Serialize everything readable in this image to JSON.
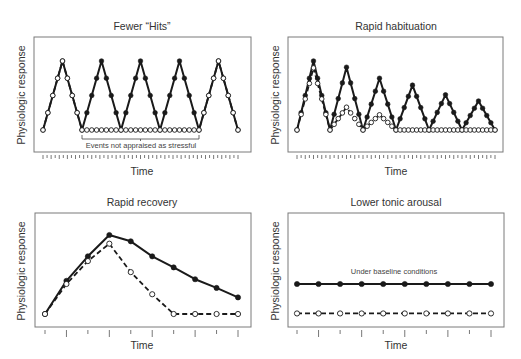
{
  "chart_data": [
    {
      "id": "fewer-hits",
      "type": "line",
      "title": "Fewer “Hits”",
      "xlabel": "Time",
      "ylabel": "Physiologic response",
      "grid": false,
      "legend": null,
      "frame": {
        "x0": 34,
        "y0": 37,
        "x1": 251,
        "y1": 152
      },
      "ylim": [
        0,
        1
      ],
      "annotation": {
        "text": "Events not appraised as stressful",
        "x0": 82,
        "x1": 199,
        "y": 139
      },
      "tick_count": 49,
      "minor_ticks": true,
      "series": [
        {
          "name": "Filled (stress-prone)",
          "style": "filled",
          "values": [
            0,
            0.25,
            0.5,
            0.75,
            1,
            0.75,
            0.5,
            0.25,
            0,
            0.25,
            0.5,
            0.75,
            1,
            0.75,
            0.5,
            0.25,
            0,
            0.25,
            0.5,
            0.75,
            1,
            0.75,
            0.5,
            0.25,
            0,
            0.25,
            0.5,
            0.75,
            1,
            0.75,
            0.5,
            0.25,
            0,
            0.25,
            0.5,
            0.75,
            1,
            0.75,
            0.5,
            0.25,
            0
          ]
        },
        {
          "name": "Open (fewer hits)",
          "style": "open",
          "values": [
            0,
            0.25,
            0.5,
            0.75,
            1,
            0.75,
            0.5,
            0.25,
            0,
            0,
            0,
            0,
            0,
            0,
            0,
            0,
            0,
            0,
            0,
            0,
            0,
            0,
            0,
            0,
            0,
            0,
            0,
            0,
            0,
            0,
            0,
            0,
            0,
            0.25,
            0.5,
            0.75,
            1,
            0.75,
            0.5,
            0.25,
            0
          ]
        }
      ]
    },
    {
      "id": "rapid-habituation",
      "type": "line",
      "title": "Rapid habituation",
      "xlabel": "Time",
      "ylabel": "Physiologic response",
      "grid": false,
      "legend": null,
      "frame": {
        "x0": 288,
        "y0": 37,
        "x1": 503,
        "y1": 152
      },
      "ylim": [
        0,
        1
      ],
      "tick_count": 49,
      "minor_ticks": true,
      "series": [
        {
          "name": "Filled (no habituation)",
          "style": "filled",
          "peaks": [
            1.0,
            0.91,
            0.75,
            0.65,
            0.51,
            0.42
          ]
        },
        {
          "name": "Open (rapid habituation)",
          "style": "open",
          "peaks": [
            0.9,
            0.33,
            0.22,
            0,
            0,
            0
          ]
        }
      ]
    },
    {
      "id": "rapid-recovery",
      "type": "line",
      "title": "Rapid recovery",
      "xlabel": "Time",
      "ylabel": "Physiologic response",
      "grid": false,
      "legend": null,
      "frame": {
        "x0": 35,
        "y0": 213,
        "x1": 251,
        "y1": 327
      },
      "ylim": [
        0,
        1
      ],
      "x": [
        1,
        2,
        3,
        4,
        5,
        6,
        7,
        8,
        9,
        10
      ],
      "tick_count": 10,
      "minor_ticks": false,
      "series": [
        {
          "name": "Filled (slow recovery)",
          "style": "filled",
          "values": [
            0.0,
            0.42,
            0.73,
            1.0,
            0.92,
            0.73,
            0.59,
            0.44,
            0.33,
            0.21
          ]
        },
        {
          "name": "Open (rapid recovery)",
          "style": "open",
          "values": [
            0.0,
            0.38,
            0.67,
            0.89,
            0.53,
            0.25,
            0.0,
            0.0,
            0.0,
            0.0
          ]
        }
      ]
    },
    {
      "id": "lower-tonic-arousal",
      "type": "line",
      "title": "Lower tonic arousal",
      "xlabel": "Time",
      "ylabel": "Physiologic response",
      "grid": false,
      "legend": null,
      "frame": {
        "x0": 288,
        "y0": 213,
        "x1": 504,
        "y1": 327
      },
      "ylim": [
        0,
        1
      ],
      "x": [
        1,
        2,
        3,
        4,
        5,
        6,
        7,
        8,
        9,
        10
      ],
      "tick_count": 10,
      "minor_ticks": false,
      "annotation": {
        "text": "Under baseline conditions",
        "x": 394,
        "y": 274
      },
      "series": [
        {
          "name": "Filled (higher tonic arousal)",
          "style": "filled",
          "values": [
            0.38,
            0.38,
            0.38,
            0.38,
            0.38,
            0.38,
            0.38,
            0.38,
            0.38,
            0.38
          ]
        },
        {
          "name": "Open (lower tonic arousal)",
          "style": "open",
          "values": [
            0.08,
            0.08,
            0.08,
            0.08,
            0.08,
            0.08,
            0.08,
            0.08,
            0.08,
            0.08
          ]
        }
      ]
    }
  ],
  "panels": [
    {
      "title": "Fewer “Hits”",
      "xlabel": "Time",
      "ylabel": "Physiologic response",
      "annotation": "Events not appraised as stressful"
    },
    {
      "title": "Rapid habituation",
      "xlabel": "Time",
      "ylabel": "Physiologic response"
    },
    {
      "title": "Rapid recovery",
      "xlabel": "Time",
      "ylabel": "Physiologic response"
    },
    {
      "title": "Lower tonic arousal",
      "xlabel": "Time",
      "ylabel": "Physiologic response",
      "annotation": "Under baseline conditions"
    }
  ],
  "colors": {
    "line": "#1a1a1a",
    "frame": "#7a7a7a",
    "text": "#333333",
    "background": "#ffffff"
  }
}
